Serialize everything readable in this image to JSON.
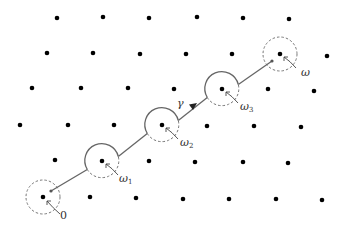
{
  "diagram": {
    "lattice_points": [
      [
        57,
        18
      ],
      [
        103,
        17
      ],
      [
        149,
        18
      ],
      [
        197,
        17
      ],
      [
        243,
        18
      ],
      [
        289,
        19
      ],
      [
        47,
        53
      ],
      [
        93,
        53
      ],
      [
        140,
        54
      ],
      [
        186,
        54
      ],
      [
        232,
        54
      ],
      [
        280,
        54
      ],
      [
        327,
        56
      ],
      [
        32,
        88
      ],
      [
        81,
        88
      ],
      [
        128,
        88
      ],
      [
        174,
        89
      ],
      [
        222,
        89
      ],
      [
        268,
        89
      ],
      [
        314,
        91
      ],
      [
        20,
        125
      ],
      [
        68,
        125
      ],
      [
        114,
        125
      ],
      [
        162,
        125
      ],
      [
        207,
        126
      ],
      [
        254,
        126
      ],
      [
        301,
        127
      ],
      [
        55,
        160
      ],
      [
        102,
        161
      ],
      [
        149,
        161
      ],
      [
        195,
        162
      ],
      [
        243,
        162
      ],
      [
        288,
        163
      ],
      [
        43,
        197
      ],
      [
        90,
        197
      ],
      [
        136,
        198
      ],
      [
        183,
        199
      ],
      [
        229,
        199
      ],
      [
        276,
        199
      ],
      [
        322,
        200
      ]
    ],
    "circles": [
      {
        "id": "origin",
        "cx": 43,
        "cy": 197,
        "r": 17,
        "style": "dashed"
      },
      {
        "id": "w1",
        "cx": 102,
        "cy": 161,
        "r": 17,
        "style": "mixed"
      },
      {
        "id": "w2",
        "cx": 162,
        "cy": 125,
        "r": 17,
        "style": "mixed"
      },
      {
        "id": "w3",
        "cx": 222,
        "cy": 89,
        "r": 17,
        "style": "mixed"
      },
      {
        "id": "w",
        "cx": 280,
        "cy": 54,
        "r": 17,
        "style": "dashed"
      }
    ],
    "labels": {
      "origin": "0",
      "w1_base": "ω",
      "w1_sub": "1",
      "w2_base": "ω",
      "w2_sub": "2",
      "w3_base": "ω",
      "w3_sub": "3",
      "w": "ω",
      "gamma": "γ"
    },
    "colors": {
      "dot": "#000000",
      "path": "#666666",
      "dashed": "#777777",
      "label": "#333333"
    }
  }
}
